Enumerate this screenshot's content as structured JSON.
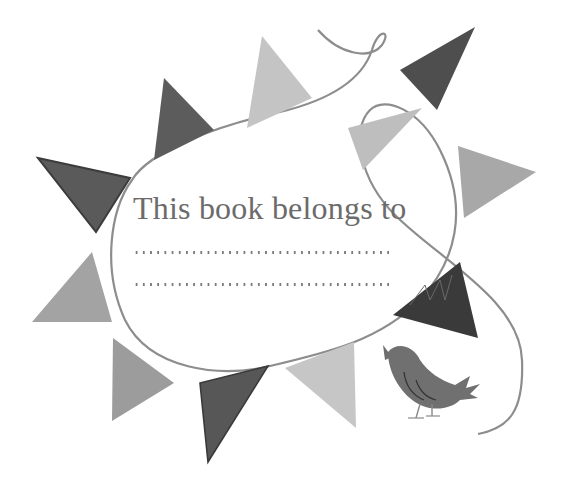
{
  "bookplate": {
    "heading": "This book belongs to",
    "name_lines": [
      {
        "value": ""
      },
      {
        "value": ""
      }
    ]
  },
  "colors": {
    "background": "#ffffff",
    "text": "#6b6b6b",
    "string": "#8a8a8a",
    "flag_dark": "#555555",
    "flag_darkest": "#3a3a3a",
    "flag_mid": "#9a9a9a",
    "flag_light": "#bdbdbd",
    "bird": "#6e6e6e"
  },
  "illustration": {
    "flags_count": 11,
    "bird": "singing-bird"
  }
}
